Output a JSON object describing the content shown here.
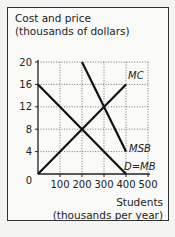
{
  "chart_data": {
    "type": "line",
    "title": "",
    "ylabel": "Cost and price (thousands of dollars)",
    "ylabel_line1": "Cost and price",
    "ylabel_line2": "(thousands of dollars)",
    "xlabel": "Students (thousands per year)",
    "xlabel_line1": "Students",
    "xlabel_line2": "(thousands per year)",
    "xlim": [
      0,
      500
    ],
    "ylim": [
      0,
      20
    ],
    "x_ticks": [
      100,
      200,
      300,
      400,
      500
    ],
    "x_tick_labels": [
      "100",
      "200",
      "300",
      "400",
      "500"
    ],
    "y_ticks": [
      4,
      8,
      12,
      16,
      20
    ],
    "y_tick_labels": [
      "4",
      "8",
      "12",
      "16",
      "20"
    ],
    "origin_label": "0",
    "grid": true,
    "grid_style": "dotted",
    "legend": "inline labels at line ends",
    "series": [
      {
        "name": "MC",
        "label": "MC",
        "points": [
          [
            0,
            0
          ],
          [
            400,
            16
          ]
        ]
      },
      {
        "name": "MSB",
        "label": "MSB",
        "points": [
          [
            200,
            20
          ],
          [
            400,
            4
          ]
        ]
      },
      {
        "name": "D=MB",
        "label": "D=MB",
        "points": [
          [
            0,
            16
          ],
          [
            400,
            0
          ]
        ]
      }
    ]
  }
}
